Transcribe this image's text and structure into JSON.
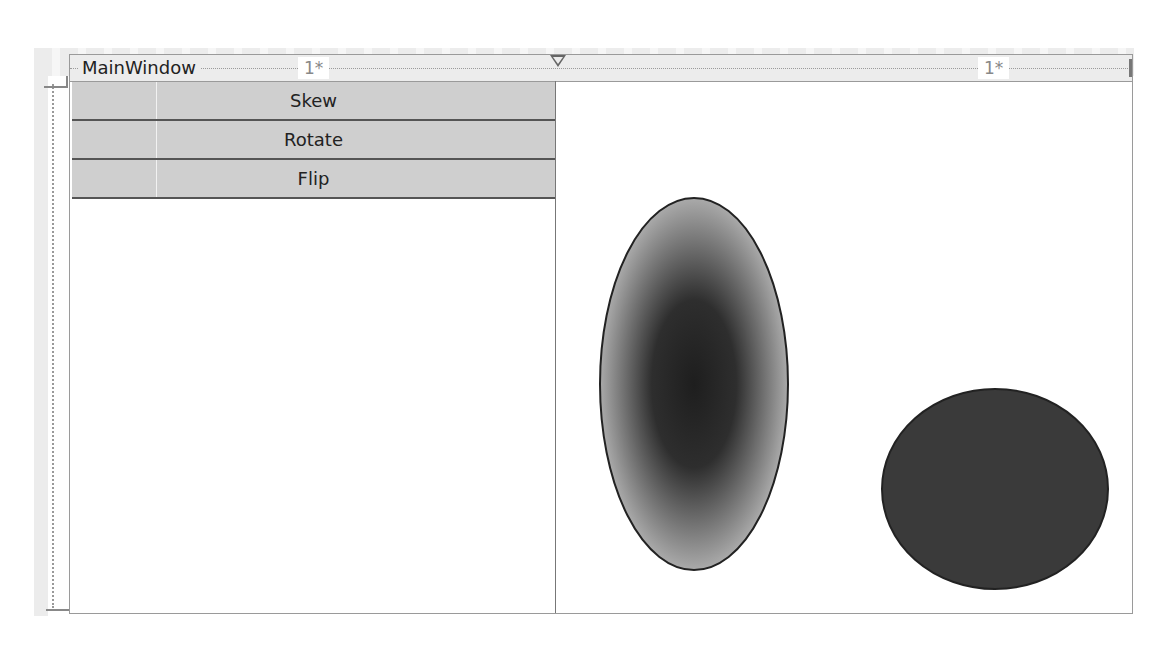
{
  "window": {
    "title": "MainWindow"
  },
  "grid": {
    "columns": [
      {
        "width_label": "1*"
      },
      {
        "width_label": "1*"
      }
    ]
  },
  "buttons": [
    {
      "label": "Skew"
    },
    {
      "label": "Rotate"
    },
    {
      "label": "Flip"
    }
  ],
  "shapes": [
    {
      "type": "ellipse",
      "name": "gradient-ellipse",
      "fill": "radial-gradient",
      "center_color": "#1e1e1e",
      "edge_color": "#a8a8a8",
      "stroke": "#222222"
    },
    {
      "type": "ellipse",
      "name": "solid-ellipse",
      "fill": "#3a3a3a",
      "stroke": "#222222"
    }
  ],
  "colors": {
    "button_bg": "#cfcfcf",
    "button_border": "#555555",
    "ruler_bg": "#ececec"
  }
}
